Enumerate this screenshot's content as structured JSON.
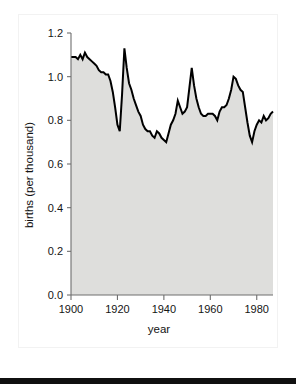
{
  "figure": {
    "background_color": "#ffffff",
    "fill_color": "#dededc",
    "line_color": "#000000",
    "axis_color": "#6e6e6e"
  },
  "chart_data": {
    "type": "area",
    "title": "",
    "xlabel": "year",
    "ylabel": "births (per thousand)",
    "xlim": [
      1900,
      1987
    ],
    "ylim": [
      0.0,
      1.2
    ],
    "grid": false,
    "legend": "none",
    "xticks": [
      1900,
      1920,
      1940,
      1960,
      1980
    ],
    "xtick_labels": [
      "1900",
      "1920",
      "1940",
      "1960",
      "1980"
    ],
    "yticks": [
      0.0,
      0.2,
      0.4,
      0.6,
      0.8,
      1.0,
      1.2
    ],
    "ytick_labels": [
      "0.0",
      "0.2",
      "0.4",
      "0.6",
      "0.8",
      "1.0",
      "1.2"
    ],
    "series": [
      {
        "name": "births",
        "x": [
          1900,
          1901,
          1902,
          1903,
          1904,
          1905,
          1906,
          1907,
          1908,
          1909,
          1910,
          1911,
          1912,
          1913,
          1914,
          1915,
          1916,
          1917,
          1918,
          1919,
          1920,
          1921,
          1922,
          1923,
          1924,
          1925,
          1926,
          1927,
          1928,
          1929,
          1930,
          1931,
          1932,
          1933,
          1934,
          1935,
          1936,
          1937,
          1938,
          1939,
          1940,
          1941,
          1942,
          1943,
          1944,
          1945,
          1946,
          1947,
          1948,
          1949,
          1950,
          1951,
          1952,
          1953,
          1954,
          1955,
          1956,
          1957,
          1958,
          1959,
          1960,
          1961,
          1962,
          1963,
          1964,
          1965,
          1966,
          1967,
          1968,
          1969,
          1970,
          1971,
          1972,
          1973,
          1974,
          1975,
          1976,
          1977,
          1978,
          1979,
          1980,
          1981,
          1982,
          1983,
          1984,
          1985,
          1986,
          1987
        ],
        "values": [
          1.09,
          1.09,
          1.09,
          1.08,
          1.1,
          1.08,
          1.11,
          1.09,
          1.08,
          1.07,
          1.06,
          1.05,
          1.03,
          1.02,
          1.02,
          1.01,
          1.01,
          0.98,
          0.93,
          0.86,
          0.78,
          0.75,
          0.92,
          1.13,
          1.04,
          0.97,
          0.94,
          0.9,
          0.87,
          0.84,
          0.82,
          0.78,
          0.76,
          0.75,
          0.75,
          0.73,
          0.72,
          0.75,
          0.74,
          0.72,
          0.71,
          0.7,
          0.74,
          0.78,
          0.8,
          0.83,
          0.89,
          0.86,
          0.83,
          0.84,
          0.86,
          0.95,
          1.04,
          0.96,
          0.9,
          0.86,
          0.83,
          0.82,
          0.82,
          0.83,
          0.83,
          0.83,
          0.82,
          0.8,
          0.84,
          0.86,
          0.86,
          0.87,
          0.9,
          0.94,
          1.0,
          0.99,
          0.96,
          0.94,
          0.93,
          0.86,
          0.79,
          0.73,
          0.7,
          0.75,
          0.78,
          0.8,
          0.79,
          0.82,
          0.8,
          0.81,
          0.83,
          0.84
        ]
      }
    ]
  }
}
